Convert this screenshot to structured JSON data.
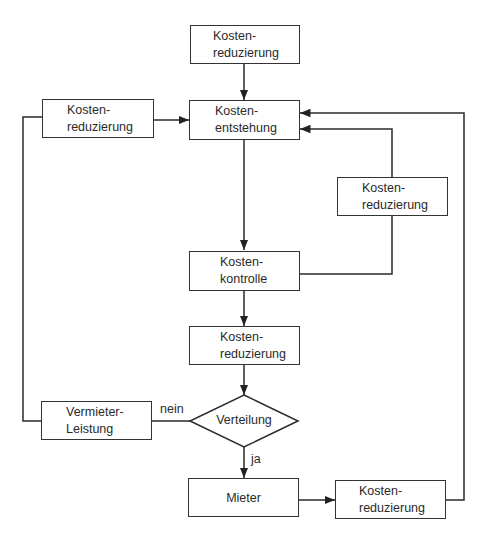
{
  "diagram": {
    "type": "flowchart",
    "nodes": {
      "top_reduction": {
        "line1": "Kosten-",
        "line2": "reduzierung"
      },
      "left_reduction": {
        "line1": "Kosten-",
        "line2": "reduzierung"
      },
      "origin": {
        "line1": "Kosten-",
        "line2": "entstehung"
      },
      "right_reduction": {
        "line1": "Kosten-",
        "line2": "reduzierung"
      },
      "control": {
        "line1": "Kosten-",
        "line2": "kontrolle"
      },
      "mid_reduction": {
        "line1": "Kosten-",
        "line2": "reduzierung"
      },
      "landlord": {
        "line1": "Vermieter-",
        "line2": "Leistung"
      },
      "distribution": {
        "label": "Verteilung"
      },
      "tenant": {
        "label": "Mieter"
      },
      "bottom_reduction": {
        "line1": "Kosten-",
        "line2": "reduzierung"
      }
    },
    "edge_labels": {
      "no": "nein",
      "yes": "ja"
    },
    "edges": [
      {
        "from": "top_reduction",
        "to": "origin"
      },
      {
        "from": "left_reduction",
        "to": "origin"
      },
      {
        "from": "origin",
        "to": "control"
      },
      {
        "from": "control",
        "to": "right_reduction"
      },
      {
        "from": "right_reduction",
        "to": "origin"
      },
      {
        "from": "control",
        "to": "mid_reduction"
      },
      {
        "from": "mid_reduction",
        "to": "distribution"
      },
      {
        "from": "distribution",
        "to": "landlord",
        "label": "nein"
      },
      {
        "from": "landlord",
        "to": "left_reduction"
      },
      {
        "from": "distribution",
        "to": "tenant",
        "label": "ja"
      },
      {
        "from": "tenant",
        "to": "bottom_reduction"
      },
      {
        "from": "bottom_reduction",
        "to": "origin"
      }
    ]
  }
}
